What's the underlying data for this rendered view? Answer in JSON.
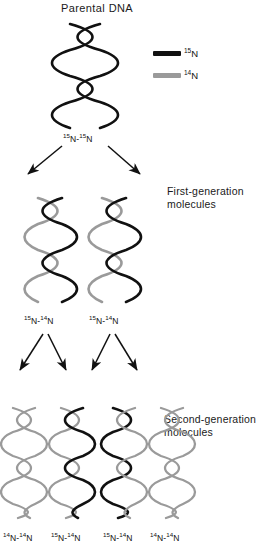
{
  "figure": {
    "title": "Parental DNA",
    "colors": {
      "n15": "#111111",
      "n14": "#9a9a9a",
      "background": "#ffffff",
      "text": "#1a1a1a"
    }
  },
  "legend": {
    "items": [
      {
        "label": "N",
        "superscript": "15",
        "color": "#111111",
        "swatch_name": "n15-swatch"
      },
      {
        "label": "N",
        "superscript": "14",
        "color": "#9a9a9a",
        "swatch_name": "n14-swatch"
      }
    ]
  },
  "parental": {
    "label": "Parental DNA",
    "genotype_sup_a": "15",
    "genotype_mid": "N-",
    "genotype_sup_b": "15",
    "genotype_end": "N",
    "strands": [
      "n15",
      "n15"
    ]
  },
  "generation_one": {
    "caption_line1": "First-generation",
    "caption_line2": "molecules",
    "molecules": [
      {
        "sup_a": "15",
        "mid": "N-",
        "sup_b": "14",
        "end": "N",
        "strands": [
          "n14",
          "n15"
        ]
      },
      {
        "sup_a": "15",
        "mid": "N-",
        "sup_b": "14",
        "end": "N",
        "strands": [
          "n14",
          "n15"
        ]
      }
    ]
  },
  "generation_two": {
    "caption_line1": "Second-generation",
    "caption_line2": "molecules",
    "molecules": [
      {
        "sup_a": "14",
        "mid": "N-",
        "sup_b": "14",
        "end": "N",
        "strands": [
          "n14",
          "n14"
        ]
      },
      {
        "sup_a": "15",
        "mid": "N-",
        "sup_b": "14",
        "end": "N",
        "strands": [
          "n14",
          "n15"
        ]
      },
      {
        "sup_a": "15",
        "mid": "N-",
        "sup_b": "14",
        "end": "N",
        "strands": [
          "n15",
          "n14"
        ]
      },
      {
        "sup_a": "14",
        "mid": "N-",
        "sup_b": "14",
        "end": "N",
        "strands": [
          "n14",
          "n14"
        ]
      }
    ]
  }
}
